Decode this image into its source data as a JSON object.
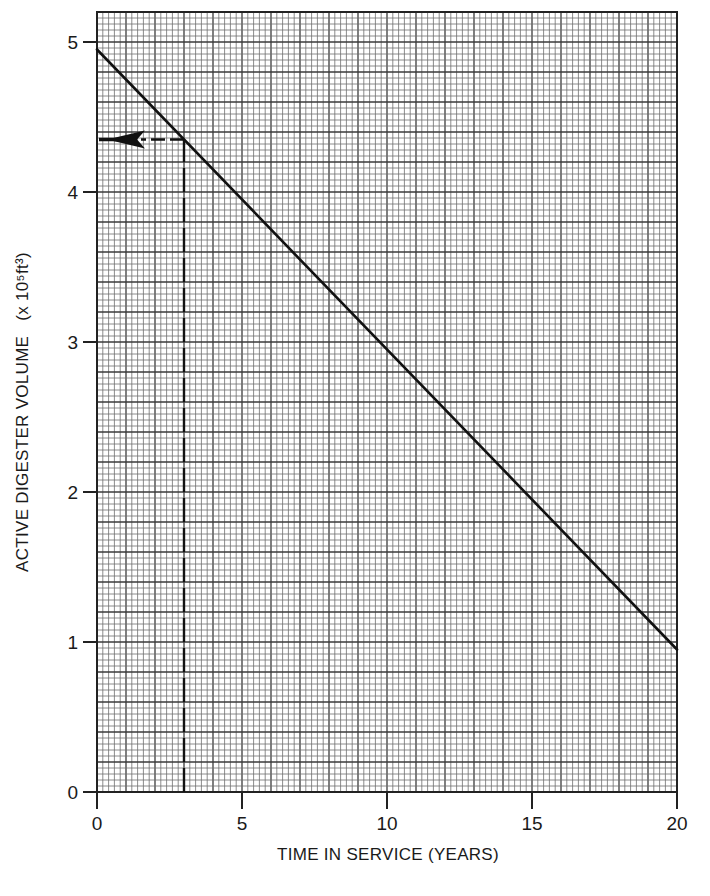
{
  "chart_data": {
    "type": "line",
    "title": "",
    "xlabel": "TIME IN SERVICE (YEARS)",
    "ylabel": "ACTIVE DIGESTER VOLUME (x 10⁵ft³)",
    "ylabel_main": "ACTIVE DIGESTER VOLUME",
    "ylabel_units": "(x 10⁵ft³)",
    "xlim": [
      0,
      20
    ],
    "ylim": [
      0,
      5.2
    ],
    "x_ticks": [
      0,
      5,
      10,
      15,
      20
    ],
    "x_tick_labels": [
      "0",
      "5",
      "10",
      "15",
      "20"
    ],
    "y_ticks": [
      0,
      1,
      2,
      3,
      4,
      5
    ],
    "y_tick_labels": [
      "0",
      "1",
      "2",
      "3",
      "4",
      "5"
    ],
    "grid": {
      "on": true,
      "minor_x_step": 0.2,
      "minor_y_step": 0.04,
      "major_x_step": 1,
      "major_y_step": 0.2
    },
    "legend": null,
    "series": [
      {
        "name": "Active digester volume",
        "style": "solid",
        "x": [
          0,
          20
        ],
        "y": [
          4.95,
          0.95
        ]
      }
    ],
    "annotations": [
      {
        "type": "dashed-vertical",
        "x": 3,
        "y_from": 0,
        "y_to": 4.35
      },
      {
        "type": "dashed-horizontal-arrow",
        "y": 4.35,
        "x_from": 3,
        "x_to": 0,
        "arrow_direction": "left"
      }
    ],
    "colors": {
      "line": "#111111",
      "grid_minor": "#6f6f6f",
      "grid_major": "#3a3a3a",
      "background": "#ffffff"
    }
  }
}
